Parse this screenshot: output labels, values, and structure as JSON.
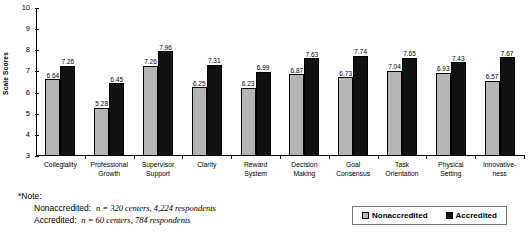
{
  "chart_data": {
    "type": "bar",
    "title": "",
    "xlabel": "",
    "ylabel": "Scale Scores",
    "ylim": [
      3,
      10
    ],
    "yticks": [
      3,
      4,
      5,
      6,
      7,
      8,
      9,
      10
    ],
    "grid": false,
    "legend_position": "bottom-right",
    "categories": [
      "Collegiality",
      "Professional\nGrowth",
      "Supervisor\nSupport",
      "Clarity",
      "Reward\nSystem",
      "Decision\nMaking",
      "Goal\nConsensus",
      "Task\nOrientation",
      "Physical\nSetting",
      "Innovative-\nness"
    ],
    "series": [
      {
        "name": "Nonaccredited",
        "color": "#b5b5b5",
        "values": [
          6.64,
          5.28,
          7.26,
          6.25,
          6.23,
          6.87,
          6.73,
          7.04,
          6.93,
          6.57
        ]
      },
      {
        "name": "Accredited",
        "color": "#111111",
        "values": [
          7.26,
          6.45,
          7.96,
          7.31,
          6.99,
          7.63,
          7.74,
          7.65,
          7.43,
          7.67
        ]
      }
    ]
  },
  "note": {
    "header": "*Note:",
    "line1_label": "Nonaccredited:",
    "line1_value": "n = 320 centers, 4,224 respondents",
    "line2_label": "Accredited:",
    "line2_value": "n = 60 centers, 784 respondents"
  },
  "legend": {
    "items": [
      {
        "label": "Nonaccredited"
      },
      {
        "label": "Accredited"
      }
    ]
  }
}
